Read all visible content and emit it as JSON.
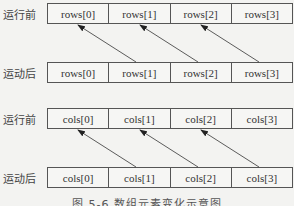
{
  "groups": [
    {
      "name": "rows",
      "before_label": "运行前",
      "after_label": "运动后",
      "before_cells": [
        "rows[0]",
        "rows[1]",
        "rows[2]",
        "rows[3]"
      ],
      "after_cells": [
        "rows[0]",
        "rows[1]",
        "rows[2]",
        "rows[3]"
      ],
      "arrows": [
        {
          "from": "after rows[1]",
          "to": "before rows[0]"
        },
        {
          "from": "after rows[2]",
          "to": "before rows[1]"
        },
        {
          "from": "after rows[3]",
          "to": "before rows[2]"
        }
      ]
    },
    {
      "name": "cols",
      "before_label": "运行前",
      "after_label": "运动后",
      "before_cells": [
        "cols[0]",
        "cols[1]",
        "cols[2]",
        "cols[3]"
      ],
      "after_cells": [
        "cols[0]",
        "cols[1]",
        "cols[2]",
        "cols[3]"
      ],
      "arrows": [
        {
          "from": "after cols[1]",
          "to": "before cols[0]"
        },
        {
          "from": "after cols[2]",
          "to": "before cols[1]"
        },
        {
          "from": "after cols[3]",
          "to": "before cols[2]"
        }
      ]
    }
  ],
  "caption": "图 5-6   数组元素变化示意图"
}
